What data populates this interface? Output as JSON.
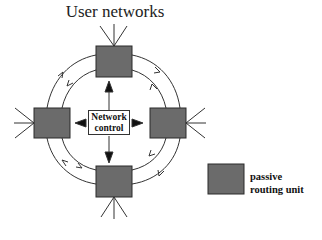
{
  "diagram": {
    "title": "User networks",
    "center_node": {
      "line1": "Network",
      "line2": "control"
    },
    "nodes": [
      {
        "id": "top",
        "type": "passive routing unit"
      },
      {
        "id": "left",
        "type": "passive routing unit"
      },
      {
        "id": "right",
        "type": "passive routing unit"
      },
      {
        "id": "bottom",
        "type": "passive routing unit"
      }
    ],
    "rings": [
      {
        "name": "outer ring",
        "direction": "clockwise"
      },
      {
        "name": "inner ring",
        "direction": "counter-clockwise"
      }
    ],
    "legend": {
      "line1": "passive",
      "line2": "routing unit"
    },
    "colors": {
      "unit_fill": "#6b6b6b",
      "unit_border": "#2a2a2a",
      "line": "#333333"
    }
  }
}
